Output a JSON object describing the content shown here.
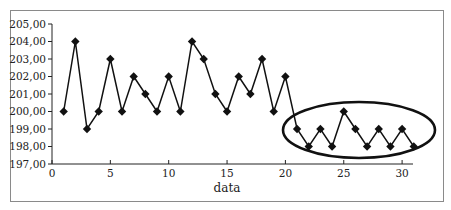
{
  "chart_data": {
    "type": "line",
    "title": "",
    "xlabel": "data",
    "ylabel": "",
    "x": [
      1,
      2,
      3,
      4,
      5,
      6,
      7,
      8,
      9,
      10,
      11,
      12,
      13,
      14,
      15,
      16,
      17,
      18,
      19,
      20,
      21,
      22,
      23,
      24,
      25,
      26,
      27,
      28,
      29,
      30,
      31
    ],
    "series": [
      {
        "name": "values",
        "marker": "diamond",
        "values": [
          200,
          204,
          199,
          200,
          203,
          200,
          202,
          201,
          200,
          202,
          200,
          204,
          203,
          201,
          200,
          202,
          201,
          203,
          200,
          202,
          199,
          198,
          199,
          198,
          200,
          199,
          198,
          199,
          198,
          199,
          198
        ]
      }
    ],
    "xlim": [
      0,
      31
    ],
    "ylim": [
      197,
      205
    ],
    "x_ticks": [
      "0",
      "5",
      "10",
      "15",
      "20",
      "25",
      "30"
    ],
    "y_ticks": [
      "197,00",
      "198,00",
      "199,00",
      "200,00",
      "201,00",
      "202,00",
      "203,00",
      "204,00",
      "205,00"
    ],
    "grid": false,
    "legend": "none",
    "annotations": [
      {
        "type": "ellipse",
        "description": "highlights points 21-31",
        "x_range": [
          21,
          31
        ]
      }
    ]
  }
}
